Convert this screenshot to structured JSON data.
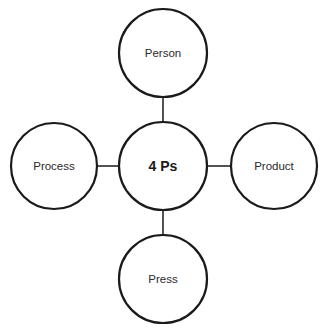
{
  "diagram": {
    "title": "4 Ps",
    "type": "hub-and-spoke",
    "center": {
      "label": "4 Ps",
      "cx": 163,
      "cy": 166,
      "r": 44
    },
    "nodes": [
      {
        "id": "top",
        "label": "Person",
        "cx": 163,
        "cy": 53,
        "r": 44
      },
      {
        "id": "left",
        "label": "Process",
        "cx": 54,
        "cy": 166,
        "r": 43
      },
      {
        "id": "right",
        "label": "Product",
        "cx": 274,
        "cy": 166,
        "r": 43
      },
      {
        "id": "bottom",
        "label": "Press",
        "cx": 163,
        "cy": 279,
        "r": 44
      }
    ],
    "colors": {
      "stroke": "#1a1a1a",
      "background": "#ffffff",
      "text": "#2a2a2a"
    }
  }
}
